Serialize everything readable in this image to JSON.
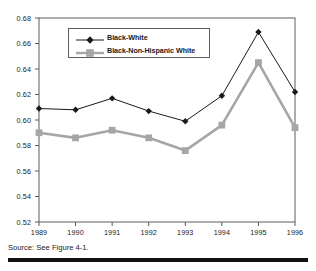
{
  "figure": {
    "source_note": "Source: See Figure 4-1.",
    "axis_color": "#5d5d5d",
    "series1_color": "#1a1a1a",
    "series2_color": "#a6a6a6"
  },
  "chart_data": {
    "type": "line",
    "title": "",
    "xlabel": "",
    "ylabel": "",
    "categories": [
      "1989",
      "1990",
      "1991",
      "1992",
      "1993",
      "1994",
      "1995",
      "1996"
    ],
    "ylim": [
      0.52,
      0.68
    ],
    "yticks": [
      "0.52",
      "0.54",
      "0.56",
      "0.58",
      "0.60",
      "0.62",
      "0.64",
      "0.66",
      "0.68"
    ],
    "ytick_values": [
      0.52,
      0.54,
      0.56,
      0.58,
      0.6,
      0.62,
      0.64,
      0.66,
      0.68
    ],
    "grid": false,
    "legend_position": "upper-left-inside",
    "series": [
      {
        "name": "Black-White",
        "marker": "diamond",
        "color": "#1a1a1a",
        "values": [
          0.609,
          0.608,
          0.617,
          0.607,
          0.599,
          0.619,
          0.669,
          0.622
        ]
      },
      {
        "name": "Black-Non-Hispanic White",
        "marker": "square",
        "color": "#a6a6a6",
        "values": [
          0.59,
          0.586,
          0.592,
          0.586,
          0.576,
          0.596,
          0.645,
          0.594
        ]
      }
    ]
  }
}
